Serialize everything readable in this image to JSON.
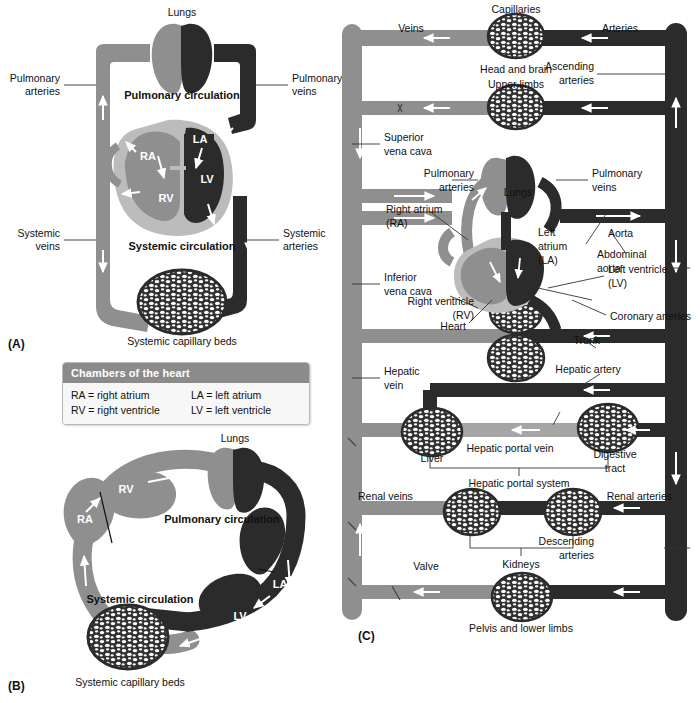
{
  "figure": {
    "panels": [
      {
        "id": "A",
        "label": "(A)"
      },
      {
        "id": "B",
        "label": "(B)"
      },
      {
        "id": "C",
        "label": "(C)"
      }
    ],
    "colors": {
      "vein_gray": "#8f8f8f",
      "vein_gray_light": "#a5a5a5",
      "artery_dark": "#2b2b2b",
      "heart_outline_gray": "#bcbcbc",
      "capillary_dark": "#333333",
      "background": "#ffffff",
      "legend_header": "#8b8b8b",
      "text": "#111111"
    }
  },
  "panel_a": {
    "tag": "(A)",
    "lungs": "Lungs",
    "pulmonary_circulation": "Pulmonary circulation",
    "systemic_circulation": "Systemic circulation",
    "pulmonary_arteries": "Pulmonary\narteries",
    "pulmonary_arteries_l1": "Pulmonary",
    "pulmonary_arteries_l2": "arteries",
    "pulmonary_veins_l1": "Pulmonary",
    "pulmonary_veins_l2": "veins",
    "systemic_veins_l1": "Systemic",
    "systemic_veins_l2": "veins",
    "systemic_arteries_l1": "Systemic",
    "systemic_arteries_l2": "arteries",
    "systemic_capillary_beds": "Systemic capillary beds",
    "chambers": {
      "ra": "RA",
      "rv": "RV",
      "la": "LA",
      "lv": "LV"
    }
  },
  "legend": {
    "title": "Chambers of the heart",
    "rows": [
      {
        "left": "RA = right atrium",
        "right": "LA = left atrium"
      },
      {
        "left": "RV = right ventricle",
        "right": "LV = left ventricle"
      }
    ]
  },
  "panel_b": {
    "tag": "(B)",
    "lungs": "Lungs",
    "pulmonary_circulation": "Pulmonary circulation",
    "systemic_circulation": "Systemic circulation",
    "systemic_capillary_beds": "Systemic capillary beds",
    "chambers": {
      "ra": "RA",
      "rv": "RV",
      "la": "LA",
      "lv": "LV"
    }
  },
  "panel_c": {
    "tag": "(C)",
    "top": {
      "veins": "Veins",
      "capillaries": "Capillaries",
      "arteries": "Arteries"
    },
    "labels": {
      "head_and_brain": "Head and brain",
      "upper_limbs": "Upper limbs",
      "ascending_arteries_l1": "Ascending",
      "ascending_arteries_l2": "arteries",
      "superior_vena_cava_l1": "Superior",
      "superior_vena_cava_l2": "vena cava",
      "pulmonary_arteries_l1": "Pulmonary",
      "pulmonary_arteries_l2": "arteries",
      "pulmonary_veins_l1": "Pulmonary",
      "pulmonary_veins_l2": "veins",
      "lungs": "Lungs",
      "right_atrium_l1": "Right atrium",
      "right_atrium_l2": "(RA)",
      "left_atrium_l1": "Left",
      "left_atrium_l2": "atrium",
      "left_atrium_l3": "(LA)",
      "aorta": "Aorta",
      "abdominal_aorta_l1": "Abdominal",
      "abdominal_aorta_l2": "aorta",
      "inferior_vena_cava_l1": "Inferior",
      "inferior_vena_cava_l2": "vena cava",
      "right_ventricle_l1": "Right ventricle",
      "right_ventricle_l2": "(RV)",
      "left_ventricle_l1": "Left ventricle",
      "left_ventricle_l2": "(LV)",
      "heart": "Heart",
      "coronary_arteries": "Coronary arteries",
      "trunk": "Trunk",
      "hepatic_vein_l1": "Hepatic",
      "hepatic_vein_l2": "vein",
      "hepatic_artery": "Hepatic artery",
      "liver": "Liver",
      "hepatic_portal_vein": "Hepatic portal vein",
      "digestive_tract_l1": "Digestive",
      "digestive_tract_l2": "tract",
      "hepatic_portal_system": "Hepatic portal system",
      "renal_veins": "Renal veins",
      "renal_arteries": "Renal arteries",
      "kidneys": "Kidneys",
      "descending_arteries_l1": "Descending",
      "descending_arteries_l2": "arteries",
      "valve": "Valve",
      "pelvis_and_lower_limbs": "Pelvis and lower limbs"
    }
  }
}
